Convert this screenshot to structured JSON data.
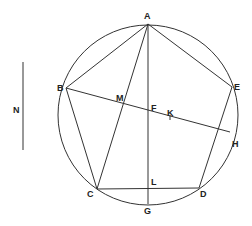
{
  "diagram": {
    "type": "geometric-construction",
    "colors": {
      "line": "#333333",
      "background": "#ffffff"
    },
    "labels": {
      "A": "A",
      "B": "B",
      "C": "C",
      "D": "D",
      "E": "E",
      "F": "F",
      "G": "G",
      "H": "H",
      "K": "K",
      "L": "L",
      "M": "M",
      "N": "N"
    },
    "points": {
      "A": [
        148,
        24
      ],
      "B": [
        66,
        88
      ],
      "C": [
        97,
        189
      ],
      "D": [
        199,
        188
      ],
      "E": [
        232,
        87
      ],
      "F": [
        148,
        112
      ],
      "G": [
        148,
        204
      ],
      "H": [
        230,
        132
      ],
      "K": [
        170,
        117
      ],
      "L": [
        148,
        188
      ],
      "M": [
        124,
        103
      ]
    },
    "circle": {
      "cx": 148,
      "cy": 115,
      "r": 90
    },
    "segment_N": {
      "x": 23,
      "y1": 62,
      "y2": 150
    }
  }
}
